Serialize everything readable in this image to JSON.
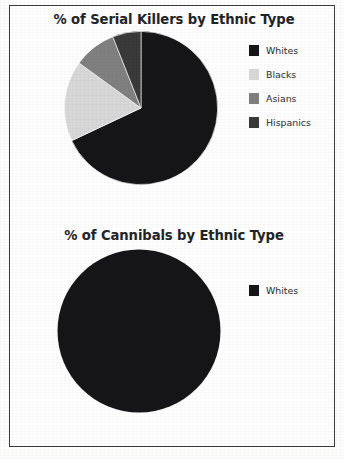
{
  "page": {
    "background_color": "#fdfdfb",
    "frame_color": "#3a3c3e"
  },
  "palette": {
    "whites": "#161618",
    "blacks": "#d8d8d8",
    "asians": "#808080",
    "hispanics": "#3a3a3a",
    "title_color": "#222426",
    "label_color": "#2b2d2f"
  },
  "charts": [
    {
      "title": "% of Serial Killers by Ethnic Type",
      "legend": [
        {
          "label": "Whites",
          "color": "#161618"
        },
        {
          "label": "Blacks",
          "color": "#d8d8d8"
        },
        {
          "label": "Asians",
          "color": "#808080"
        },
        {
          "label": "Hispanics",
          "color": "#3a3a3a"
        }
      ]
    },
    {
      "title": "% of Cannibals by Ethnic Type",
      "legend": [
        {
          "label": "Whites",
          "color": "#161618"
        }
      ]
    }
  ],
  "chart_data": [
    {
      "type": "pie",
      "title": "% of Serial Killers by Ethnic Type",
      "xlabel": "",
      "ylabel": "",
      "legend_position": "right",
      "grid": false,
      "start_angle_deg": 0,
      "direction": "clockwise",
      "categories": [
        "Whites",
        "Blacks",
        "Asians",
        "Hispanics"
      ],
      "values": [
        68,
        17,
        9,
        6
      ],
      "units": "%",
      "colors": [
        "#161618",
        "#d8d8d8",
        "#808080",
        "#3a3a3a"
      ]
    },
    {
      "type": "pie",
      "title": "% of Cannibals by Ethnic Type",
      "xlabel": "",
      "ylabel": "",
      "legend_position": "right",
      "grid": false,
      "start_angle_deg": 0,
      "direction": "clockwise",
      "categories": [
        "Whites"
      ],
      "values": [
        100
      ],
      "units": "%",
      "colors": [
        "#161618"
      ]
    }
  ]
}
